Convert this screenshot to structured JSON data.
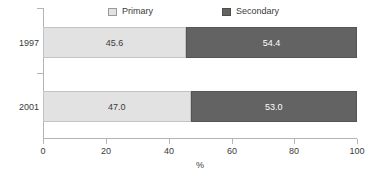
{
  "chart_data": {
    "type": "bar",
    "orientation": "horizontal",
    "stacked": true,
    "normalized_percent": true,
    "title": "",
    "subtitle": "",
    "xlabel": "%",
    "ylabel": "",
    "xlim": [
      0,
      100
    ],
    "xticks": [
      0,
      20,
      40,
      60,
      80,
      100
    ],
    "xticklabels": [
      "0",
      "20",
      "40",
      "60",
      "80",
      "100"
    ],
    "grid": false,
    "legend_position": "top",
    "categories": [
      "1997",
      "2001"
    ],
    "series": [
      {
        "name": "Primary",
        "color": "#e2e2e2",
        "values": [
          45.6,
          47.0
        ],
        "labels": [
          "45.6",
          "47.0"
        ]
      },
      {
        "name": "Secondary",
        "color": "#636363",
        "values": [
          54.4,
          53.0
        ],
        "labels": [
          "54.4",
          "53.0"
        ]
      }
    ]
  },
  "legend": {
    "items": [
      {
        "label": "Primary",
        "swatch": "legend-swatch-primary"
      },
      {
        "label": "Secondary",
        "swatch": "legend-swatch-secondary"
      }
    ]
  },
  "axis": {
    "x": {
      "title": "%",
      "ticks": [
        "0",
        "20",
        "40",
        "60",
        "80",
        "100"
      ]
    },
    "y": {
      "ticks": [
        "1997",
        "2001"
      ]
    }
  },
  "colors": {
    "primary": "#e2e2e2",
    "secondary": "#636363",
    "axis": "#b4b4b4",
    "text": "#3a3a3a",
    "background": "#ffffff"
  }
}
